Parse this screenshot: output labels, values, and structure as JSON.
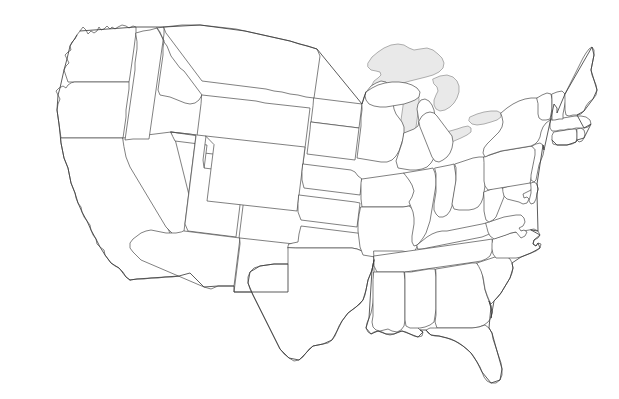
{
  "map": {
    "title": "",
    "subtitle": "",
    "region": "Contiguous United States",
    "projection": "Albers Equal Area Conic",
    "background_color": "#ffffff",
    "state_fill_color": "#ffffff",
    "state_border_color": "#4a4a4a",
    "lake_fill_color": "#e9e9e9",
    "lake_border_color": "#8e8e8e",
    "border_width_px": 0.7,
    "labels_shown": "none",
    "legend_shown": "none",
    "width_px": 619,
    "height_px": 399,
    "states": [
      {
        "code": "WA",
        "name": "Washington"
      },
      {
        "code": "OR",
        "name": "Oregon"
      },
      {
        "code": "CA",
        "name": "California"
      },
      {
        "code": "NV",
        "name": "Nevada"
      },
      {
        "code": "ID",
        "name": "Idaho"
      },
      {
        "code": "MT",
        "name": "Montana"
      },
      {
        "code": "WY",
        "name": "Wyoming"
      },
      {
        "code": "UT",
        "name": "Utah"
      },
      {
        "code": "AZ",
        "name": "Arizona"
      },
      {
        "code": "NM",
        "name": "New Mexico"
      },
      {
        "code": "CO",
        "name": "Colorado"
      },
      {
        "code": "ND",
        "name": "North Dakota"
      },
      {
        "code": "SD",
        "name": "South Dakota"
      },
      {
        "code": "NE",
        "name": "Nebraska"
      },
      {
        "code": "KS",
        "name": "Kansas"
      },
      {
        "code": "OK",
        "name": "Oklahoma"
      },
      {
        "code": "TX",
        "name": "Texas"
      },
      {
        "code": "MN",
        "name": "Minnesota"
      },
      {
        "code": "IA",
        "name": "Iowa"
      },
      {
        "code": "MO",
        "name": "Missouri"
      },
      {
        "code": "AR",
        "name": "Arkansas"
      },
      {
        "code": "LA",
        "name": "Louisiana"
      },
      {
        "code": "WI",
        "name": "Wisconsin"
      },
      {
        "code": "IL",
        "name": "Illinois"
      },
      {
        "code": "MI",
        "name": "Michigan"
      },
      {
        "code": "IN",
        "name": "Indiana"
      },
      {
        "code": "OH",
        "name": "Ohio"
      },
      {
        "code": "KY",
        "name": "Kentucky"
      },
      {
        "code": "TN",
        "name": "Tennessee"
      },
      {
        "code": "MS",
        "name": "Mississippi"
      },
      {
        "code": "AL",
        "name": "Alabama"
      },
      {
        "code": "GA",
        "name": "Georgia"
      },
      {
        "code": "FL",
        "name": "Florida"
      },
      {
        "code": "SC",
        "name": "South Carolina"
      },
      {
        "code": "NC",
        "name": "North Carolina"
      },
      {
        "code": "VA",
        "name": "Virginia"
      },
      {
        "code": "WV",
        "name": "West Virginia"
      },
      {
        "code": "MD",
        "name": "Maryland"
      },
      {
        "code": "DE",
        "name": "Delaware"
      },
      {
        "code": "PA",
        "name": "Pennsylvania"
      },
      {
        "code": "NJ",
        "name": "New Jersey"
      },
      {
        "code": "NY",
        "name": "New York"
      },
      {
        "code": "CT",
        "name": "Connecticut"
      },
      {
        "code": "RI",
        "name": "Rhode Island"
      },
      {
        "code": "MA",
        "name": "Massachusetts"
      },
      {
        "code": "VT",
        "name": "Vermont"
      },
      {
        "code": "NH",
        "name": "New Hampshire"
      },
      {
        "code": "ME",
        "name": "Maine"
      }
    ],
    "lakes": [
      {
        "name": "Lake Superior"
      },
      {
        "name": "Lake Michigan"
      },
      {
        "name": "Lake Huron"
      },
      {
        "name": "Lake Erie"
      },
      {
        "name": "Lake Ontario"
      }
    ]
  }
}
